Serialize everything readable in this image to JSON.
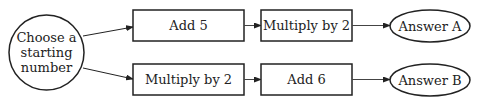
{
  "diagram": {
    "start": {
      "lines": [
        "Choose a",
        "starting",
        "number"
      ]
    },
    "top_path": {
      "step1": "Add 5",
      "step2": "Multiply by 2",
      "result": "Answer A"
    },
    "bottom_path": {
      "step1": "Multiply by 2",
      "step2": "Add 6",
      "result": "Answer B"
    }
  },
  "colors": {
    "stroke": "#222222",
    "background": "#ffffff",
    "text": "#222222"
  }
}
